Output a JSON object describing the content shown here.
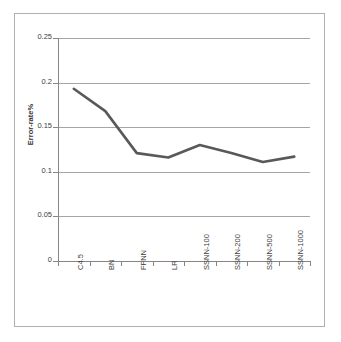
{
  "chart_data": {
    "type": "line",
    "title": "",
    "subtitle": "",
    "xlabel": "",
    "ylabel": "Error-rate%",
    "categories": [
      "C4.5",
      "BN",
      "FFNN",
      "LR",
      "SSNN-100",
      "SSNN-200",
      "SSNN-500",
      "SSNN-1000"
    ],
    "series": [
      {
        "name": "Error-rate%",
        "color": "#595959",
        "values": [
          0.193,
          0.168,
          0.121,
          0.116,
          0.13,
          0.121,
          0.111,
          0.117
        ]
      }
    ],
    "values": [
      0.193,
      0.168,
      0.121,
      0.116,
      0.13,
      0.121,
      0.111,
      0.117
    ],
    "ylim": [
      0,
      0.25
    ],
    "ytick_labels": [
      "0",
      "0.05",
      "0.1",
      "0.15",
      "0.2",
      "0.25"
    ],
    "ytick_values": [
      0,
      0.05,
      0.1,
      0.15,
      0.2,
      0.25
    ],
    "grid": true,
    "grid_axis": "y",
    "legend": false,
    "legend_position": "none",
    "markers": false,
    "line_width": 2.6,
    "colors": {
      "series": "#595959",
      "grid": "#a6a6a6",
      "axis": "#868686",
      "frame_border": "#b0b0b0",
      "text": "#404040",
      "background": "#ffffff"
    }
  },
  "axes": {
    "y_title": "Error-rate%",
    "y_ticks": [
      {
        "label": "0.25",
        "value": 0.25
      },
      {
        "label": "0.2",
        "value": 0.2
      },
      {
        "label": "0.15",
        "value": 0.15
      },
      {
        "label": "0.1",
        "value": 0.1
      },
      {
        "label": "0.05",
        "value": 0.05
      },
      {
        "label": "0",
        "value": 0
      }
    ],
    "x_ticks": [
      {
        "label": "C4.5"
      },
      {
        "label": "BN"
      },
      {
        "label": "FFNN"
      },
      {
        "label": "LR"
      },
      {
        "label": "SSNN-100"
      },
      {
        "label": "SSNN-200"
      },
      {
        "label": "SSNN-500"
      },
      {
        "label": "SSNN-1000"
      }
    ]
  }
}
